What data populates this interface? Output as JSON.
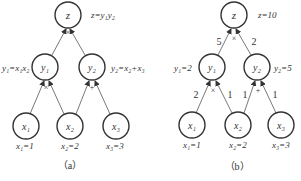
{
  "panel_a": {
    "caption": "（a）",
    "nodes": {
      "z": "z",
      "y1": "y₁",
      "y2": "y₂",
      "x1": "x₁",
      "x2": "x₂",
      "x3": "x₃"
    },
    "annotations": {
      "z": "z=y₁y₂",
      "y1": "y₁=x₁x₂",
      "y2": "y₂=x₂+x₃",
      "x1": "x₁=1",
      "x2": "x₂=2",
      "x3": "x₃=3"
    },
    "ops": {
      "z": "×",
      "y1": "×",
      "y2": "+"
    }
  },
  "panel_b": {
    "caption": "（b）",
    "nodes": {
      "z": "z",
      "y1": "y₁",
      "y2": "y₂",
      "x1": "x₁",
      "x2": "x₂",
      "x3": "x₃"
    },
    "annotations": {
      "z": "z=10",
      "y1": "y₁=2",
      "y2": "y₂=5",
      "x1": "x₁=1",
      "x2": "x₂=2",
      "x3": "x₃=3"
    },
    "ops": {
      "z": "×",
      "y1": "×",
      "y2": "+"
    },
    "gradients": {
      "y1_to_z": "5",
      "y2_to_z": "2",
      "x1_to_y1": "2",
      "x2_to_y1": "1",
      "x2_to_y2": "1",
      "x3_to_y2": "1"
    }
  }
}
